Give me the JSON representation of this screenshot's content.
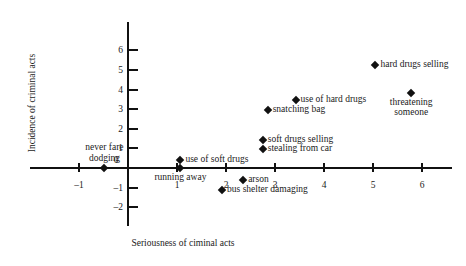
{
  "chart_data": {
    "type": "scatter",
    "title": "",
    "xlabel": "Seriousness of ciminal acts",
    "ylabel": "Incidence of criminal acts",
    "xlim": [
      -1.6,
      6.6
    ],
    "ylim": [
      -2.6,
      6.8
    ],
    "xticks": [
      -1,
      0,
      1,
      2,
      3,
      4,
      5,
      6
    ],
    "yticks": [
      -2,
      -1,
      0,
      1,
      2,
      3,
      4,
      5,
      6
    ],
    "xtick_labels": [
      "–1",
      "0",
      "1",
      "2",
      "3",
      "4",
      "5",
      "6"
    ],
    "ytick_labels": [
      "–2",
      "–1",
      "0",
      "1",
      "2",
      "3",
      "4",
      "5",
      "6"
    ],
    "grid": false,
    "legend": "none",
    "marker": "diamond",
    "marker_color": "#111111",
    "points": [
      {
        "label": "hard drugs selling",
        "x": 5.05,
        "y": 5.25,
        "label_pos": "right"
      },
      {
        "label": "threatening someone",
        "x": 5.78,
        "y": 3.85,
        "label_pos": "below"
      },
      {
        "label": "use of hard drugs",
        "x": 3.42,
        "y": 3.45,
        "label_pos": "right"
      },
      {
        "label": "snatching bag",
        "x": 2.85,
        "y": 2.95,
        "label_pos": "right"
      },
      {
        "label": "soft drugs selling",
        "x": 2.75,
        "y": 1.45,
        "label_pos": "right"
      },
      {
        "label": "stealing from car",
        "x": 2.75,
        "y": 0.95,
        "label_pos": "right"
      },
      {
        "label": "use of soft drugs",
        "x": 1.07,
        "y": 0.4,
        "label_pos": "right"
      },
      {
        "label": "running away",
        "x": 1.07,
        "y": 0.0,
        "label_pos": "below"
      },
      {
        "label": "never fare dodging",
        "x": -0.48,
        "y": 0.0,
        "label_pos": "above"
      },
      {
        "label": "arson",
        "x": 2.35,
        "y": -0.62,
        "label_pos": "right"
      },
      {
        "label": "bus shelter damaging",
        "x": 1.92,
        "y": -1.1,
        "label_pos": "right"
      }
    ]
  }
}
